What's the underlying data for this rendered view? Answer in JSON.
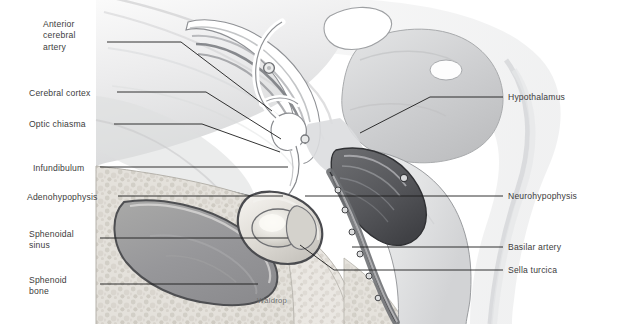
{
  "figure": {
    "signature": "Waldrop",
    "background_color": "#ffffff",
    "label_color": "#3c3c3c",
    "leader_color": "#1c1c1c"
  },
  "labels_left": [
    {
      "name": "anterior-cerebral-artery",
      "text": "Anterior\ncerebral\nartery",
      "x": 43,
      "y": 19
    },
    {
      "name": "cerebral-cortex",
      "text": "Cerebral cortex",
      "x": 29,
      "y": 88
    },
    {
      "name": "optic-chiasma",
      "text": "Optic chiasma",
      "x": 29,
      "y": 119
    },
    {
      "name": "infundibulum",
      "text": "Infundibulum",
      "x": 33,
      "y": 163
    },
    {
      "name": "adenohypophysis",
      "text": "Adenohypophysis",
      "x": 27,
      "y": 192
    },
    {
      "name": "sphenoidal-sinus",
      "text": "Sphenoidal\nsinus",
      "x": 29,
      "y": 229
    },
    {
      "name": "sphenoid-bone",
      "text": "Sphenoid\nbone",
      "x": 29,
      "y": 275
    }
  ],
  "labels_right": [
    {
      "name": "hypothalamus",
      "text": "Hypothalamus",
      "x": 508,
      "y": 92
    },
    {
      "name": "neurohypophysis",
      "text": "Neurohypophysis",
      "x": 508,
      "y": 192
    },
    {
      "name": "basilar-artery",
      "text": "Basilar artery",
      "x": 508,
      "y": 243
    },
    {
      "name": "sella-turcica",
      "text": "Sella turcica",
      "x": 508,
      "y": 265
    }
  ],
  "structures": [
    "cerebrum",
    "corpus callosum",
    "thalamus",
    "hypothalamus",
    "optic chiasma",
    "infundibulum",
    "adenohypophysis",
    "neurohypophysis",
    "sphenoidal sinus",
    "sphenoid bone",
    "sella turcica",
    "basilar artery",
    "brainstem",
    "anterior cerebral artery"
  ]
}
